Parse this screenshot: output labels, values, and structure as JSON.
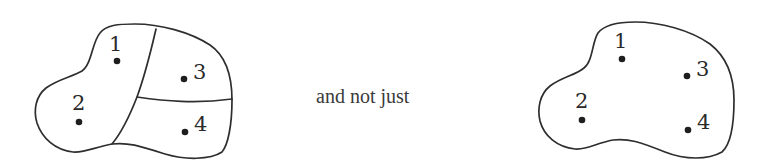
{
  "diagram": {
    "left_figure": {
      "description": "region partitioned into 3 sub-regions",
      "points": [
        {
          "label": "1",
          "x": 117,
          "y": 61
        },
        {
          "label": "2",
          "x": 79,
          "y": 122
        },
        {
          "label": "3",
          "x": 184,
          "y": 79
        },
        {
          "label": "4",
          "x": 185,
          "y": 132
        }
      ]
    },
    "connector_text": "and not just",
    "right_figure": {
      "description": "single unpartitioned region",
      "points": [
        {
          "label": "1",
          "x": 622,
          "y": 59
        },
        {
          "label": "2",
          "x": 582,
          "y": 120
        },
        {
          "label": "3",
          "x": 687,
          "y": 76
        },
        {
          "label": "4",
          "x": 688,
          "y": 130
        }
      ]
    },
    "colors": {
      "stroke": "#2e2e2e",
      "background": "#ffffff"
    }
  }
}
